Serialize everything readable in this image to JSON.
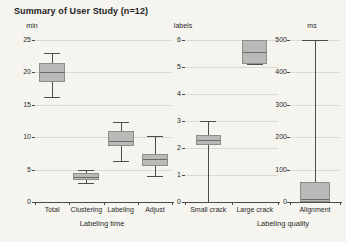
{
  "title": "Summary of User Study (n=12)",
  "colors": {
    "background": "#f5f4ef",
    "box_fill": "#b9b9b7",
    "box_border": "#8d8d8b",
    "median": "#6a6a68",
    "whisker": "#4c4c4a",
    "grid": "#d9d8d3",
    "axis": "#4a4a48",
    "text": "#2b2b29"
  },
  "chart_data": [
    {
      "type": "boxplot",
      "unit_label": "min",
      "xlabel": "Labeling time",
      "ylim": [
        0,
        25
      ],
      "yticks": [
        0,
        5,
        10,
        15,
        20,
        25
      ],
      "grid": true,
      "categories": [
        "Total",
        "Clustering",
        "Labeling",
        "Adjust"
      ],
      "series": [
        {
          "category": "Total",
          "whisker_low": 16.2,
          "q1": 18.5,
          "median": 20.0,
          "q3": 21.5,
          "whisker_high": 23.0
        },
        {
          "category": "Clustering",
          "whisker_low": 2.9,
          "q1": 3.4,
          "median": 3.9,
          "q3": 4.4,
          "whisker_high": 4.9
        },
        {
          "category": "Labeling",
          "whisker_low": 6.3,
          "q1": 8.6,
          "median": 9.4,
          "q3": 11.0,
          "whisker_high": 12.3
        },
        {
          "category": "Adjust",
          "whisker_low": 4.0,
          "q1": 5.5,
          "median": 6.7,
          "q3": 7.4,
          "whisker_high": 10.2
        }
      ]
    },
    {
      "type": "boxplot",
      "unit_label": "labels",
      "xlabel": "Labeling quality",
      "ylim": [
        0,
        6
      ],
      "yticks": [
        0,
        1,
        2,
        3,
        4,
        5,
        6
      ],
      "grid": true,
      "categories": [
        "Small crack",
        "Large crack"
      ],
      "series": [
        {
          "category": "Small crack",
          "whisker_low": 0,
          "q1": 2.1,
          "median": 2.3,
          "q3": 2.5,
          "whisker_high": 3.0
        },
        {
          "category": "Large crack",
          "whisker_low": 5.1,
          "q1": 5.1,
          "median": 5.55,
          "q3": 6.0,
          "whisker_high": 6.0
        }
      ]
    },
    {
      "type": "boxplot",
      "unit_label": "ms",
      "xlabel": "",
      "ylim": [
        0,
        500
      ],
      "yticks": [
        0,
        100,
        200,
        300,
        400,
        500
      ],
      "grid": true,
      "categories": [
        "Alignment"
      ],
      "series": [
        {
          "category": "Alignment",
          "whisker_low": 0,
          "q1": 0,
          "median": 8,
          "q3": 62,
          "whisker_high": 500
        }
      ]
    }
  ]
}
